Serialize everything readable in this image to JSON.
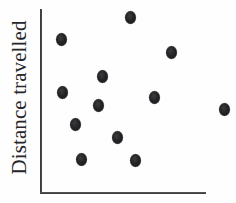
{
  "figure": {
    "axes": {
      "y_axis_label": "Distance travelled",
      "x_axis_label": "",
      "axis_color": "#2e2e30",
      "y_axis_x": 41,
      "x_axis_y": 193
    },
    "marker": {
      "shape": "filled-ellipse",
      "color": "#232325",
      "width_px": 11,
      "height_px": 13
    },
    "background_color": "#fefefe"
  },
  "chart_data": {
    "type": "scatter",
    "title": "",
    "xlabel": "",
    "ylabel": "Distance travelled",
    "grid": false,
    "legend": false,
    "xlim": [
      0,
      100
    ],
    "ylim": [
      0,
      100
    ],
    "x_tick_labels": [],
    "y_tick_labels": [],
    "n_points": 12,
    "series": [
      {
        "name": "observations",
        "color": "#232325",
        "points": [
          {
            "px": 61,
            "py": 39,
            "x": 12.2,
            "y": 84.1
          },
          {
            "px": 130,
            "py": 17,
            "x": 54.3,
            "y": 96.2
          },
          {
            "px": 171,
            "py": 52,
            "x": 79.3,
            "y": 77.0
          },
          {
            "px": 102,
            "py": 76,
            "x": 37.2,
            "y": 63.8
          },
          {
            "px": 62,
            "py": 92,
            "x": 12.8,
            "y": 55.0
          },
          {
            "px": 154,
            "py": 97,
            "x": 68.9,
            "y": 52.2
          },
          {
            "px": 98,
            "py": 105,
            "x": 34.8,
            "y": 47.8
          },
          {
            "px": 224,
            "py": 109,
            "x": 111.6,
            "y": 45.6
          },
          {
            "px": 75,
            "py": 124,
            "x": 20.7,
            "y": 37.4
          },
          {
            "px": 117,
            "py": 137,
            "x": 46.3,
            "y": 30.2
          },
          {
            "px": 81,
            "py": 159,
            "x": 24.4,
            "y": 18.1
          },
          {
            "px": 135,
            "py": 160,
            "x": 57.3,
            "y": 17.6
          }
        ]
      }
    ]
  }
}
